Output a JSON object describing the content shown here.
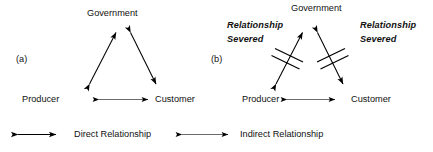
{
  "figure": {
    "type": "diagram",
    "panels": [
      {
        "tag": "(a)",
        "nodes": {
          "top": "Government",
          "left": "Producer",
          "right": "Customer"
        },
        "edges": [
          {
            "from": "Producer",
            "to": "Government",
            "style": "direct",
            "severed": false
          },
          {
            "from": "Government",
            "to": "Customer",
            "style": "direct",
            "severed": false
          },
          {
            "from": "Producer",
            "to": "Customer",
            "style": "indirect",
            "severed": false
          }
        ]
      },
      {
        "tag": "(b)",
        "nodes": {
          "top": "Government",
          "left": "Producer",
          "right": "Customer"
        },
        "annotations": {
          "left_line1": "Relationship",
          "left_line2": "Severed",
          "right_line1": "Relationship",
          "right_line2": "Severed"
        },
        "edges": [
          {
            "from": "Producer",
            "to": "Government",
            "style": "direct",
            "severed": true
          },
          {
            "from": "Government",
            "to": "Customer",
            "style": "direct",
            "severed": true
          },
          {
            "from": "Producer",
            "to": "Customer",
            "style": "indirect",
            "severed": false
          }
        ]
      }
    ]
  },
  "legend": {
    "items": [
      {
        "icon": "double-arrow-thick",
        "label": "Direct Relationship"
      },
      {
        "icon": "double-arrow-thin",
        "label": "Indirect Relationship"
      }
    ]
  },
  "colors": {
    "ink": "#000000",
    "background": "#ffffff",
    "thin_line": "#3a3a3a"
  }
}
